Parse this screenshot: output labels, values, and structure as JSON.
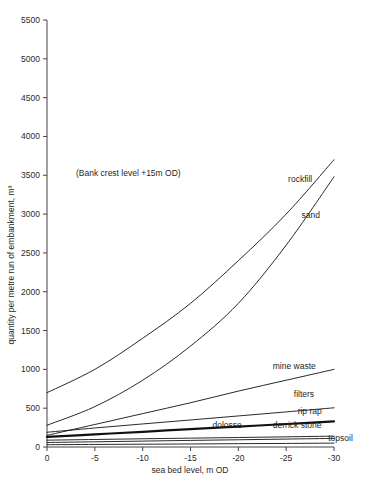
{
  "chart_data": {
    "type": "line",
    "title": "",
    "xlabel": "sea bed level, m OD",
    "ylabel": "quantity per metre run of embankment, m³",
    "xlim": [
      0,
      -30
    ],
    "ylim": [
      0,
      5500
    ],
    "xticks": [
      "0",
      "-5",
      "-10",
      "-15",
      "-20",
      "-25",
      "-30"
    ],
    "xtick_values": [
      0,
      -5,
      -10,
      -15,
      -20,
      -25,
      -30
    ],
    "yticks": [
      "0",
      "500",
      "1000",
      "1500",
      "2000",
      "2500",
      "3000",
      "3500",
      "4000",
      "4500",
      "5000",
      "5500"
    ],
    "ytick_values": [
      0,
      500,
      1000,
      1500,
      2000,
      2500,
      3000,
      3500,
      4000,
      4500,
      5000,
      5500
    ],
    "grid": false,
    "legend_position": "inline-right",
    "annotations": [
      {
        "text": "(Bank crest level +15m OD)",
        "x": -8.5,
        "y": 3490
      }
    ],
    "x": [
      0,
      -5,
      -10,
      -15,
      -20,
      -25,
      -30
    ],
    "series": [
      {
        "name": "rockfill",
        "label": "rockfill",
        "values": [
          700,
          1000,
          1400,
          1850,
          2400,
          3000,
          3700
        ],
        "stroke_width": 0.9
      },
      {
        "name": "sand",
        "label": "sand",
        "values": [
          280,
          520,
          860,
          1300,
          1850,
          2600,
          3480
        ],
        "stroke_width": 0.9
      },
      {
        "name": "mine waste",
        "label": "mine waste",
        "values": [
          150,
          290,
          430,
          570,
          720,
          860,
          1000
        ],
        "stroke_width": 0.9
      },
      {
        "name": "filters",
        "label": "filters",
        "values": [
          190,
          245,
          297,
          348,
          400,
          452,
          505
        ],
        "stroke_width": 0.9
      },
      {
        "name": "rip rap",
        "label": "rip rap",
        "values": [
          130,
          163,
          196,
          230,
          263,
          296,
          330
        ],
        "stroke_width": 2.2
      },
      {
        "name": "derrick stone",
        "label": "derrick stone",
        "values": [
          88,
          97,
          106,
          114,
          122,
          131,
          140
        ],
        "stroke_width": 0.9
      },
      {
        "name": "dolosse",
        "label": "dolosse",
        "values": [
          58,
          67,
          76,
          85,
          93,
          102,
          111
        ],
        "stroke_width": 0.9
      },
      {
        "name": "topsoil",
        "label": "topsoil",
        "values": [
          30,
          33,
          36,
          39,
          43,
          46,
          50
        ],
        "stroke_width": 0.9
      }
    ],
    "series_label_anchors": [
      {
        "name": "rockfill",
        "x": -25.2,
        "y": 3410,
        "dx": 0,
        "dy": 0
      },
      {
        "name": "sand",
        "x": -26.6,
        "y": 2950,
        "dx": 0,
        "dy": 0
      },
      {
        "name": "mine waste",
        "x": -23.6,
        "y": 1000,
        "dx": 0,
        "dy": 0
      },
      {
        "name": "filters",
        "x": -25.8,
        "y": 640,
        "dx": 0,
        "dy": 0
      },
      {
        "name": "rip rap",
        "x": -26.2,
        "y": 430,
        "dx": 0,
        "dy": 0
      },
      {
        "name": "derrick stone",
        "x": -23.6,
        "y": 250,
        "dx": 0,
        "dy": 0
      },
      {
        "name": "dolosse",
        "x": -17.3,
        "y": 250,
        "dx": 0,
        "dy": 0
      },
      {
        "name": "topsoil",
        "x": -29.4,
        "y": 72,
        "dx": 0,
        "dy": 0
      }
    ]
  }
}
